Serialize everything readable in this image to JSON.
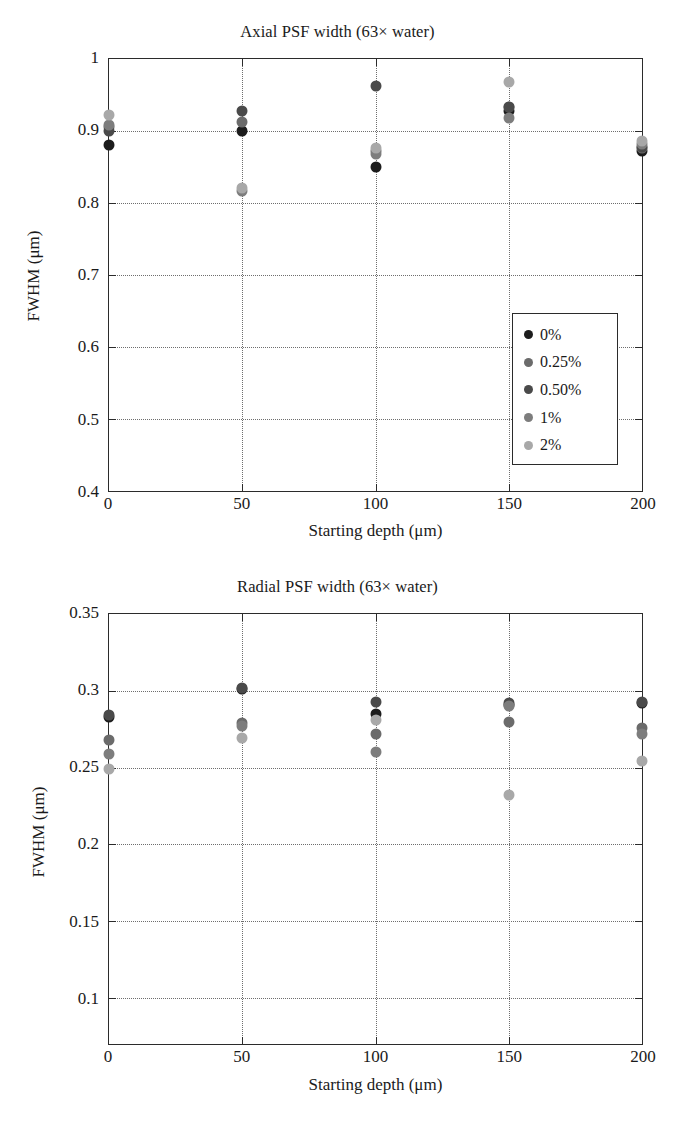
{
  "figures": [
    {
      "id": "axial",
      "title": "Axial PSF width (63× water)",
      "xlabel": "Starting depth (μm)",
      "ylabel": "FWHM (μm)"
    },
    {
      "id": "radial",
      "title": "Radial PSF width (63× water)",
      "xlabel": "Starting depth (μm)",
      "ylabel": "FWHM (μm)"
    }
  ],
  "legend": {
    "entries": [
      {
        "label": "0%",
        "color": "#1c1c1c"
      },
      {
        "label": "0.25%",
        "color": "#6b6b6b"
      },
      {
        "label": "0.50%",
        "color": "#4a4a4a"
      },
      {
        "label": "1%",
        "color": "#7d7d7d"
      },
      {
        "label": "2%",
        "color": "#a8a8a8"
      }
    ]
  },
  "chart_data": [
    {
      "type": "scatter",
      "title": "Axial PSF width (63× water)",
      "xlabel": "Starting depth (μm)",
      "ylabel": "FWHM (μm)",
      "x": [
        0,
        50,
        100,
        150,
        200
      ],
      "xlim": [
        0,
        200
      ],
      "ylim": [
        0.4,
        1.0
      ],
      "xticks": [
        0,
        50,
        100,
        150,
        200
      ],
      "yticks": [
        0.4,
        0.5,
        0.6,
        0.7,
        0.8,
        0.9,
        1.0
      ],
      "ytick_labels": [
        "0.4",
        "0.5",
        "0.6",
        "0.7",
        "0.8",
        "0.9",
        "1"
      ],
      "xtick_labels": [
        "0",
        "50",
        "100",
        "150",
        "200"
      ],
      "gridlines_y": [
        0.5,
        0.6,
        0.7,
        0.8,
        0.9
      ],
      "gridlines_x": [
        50,
        100,
        150
      ],
      "grid": true,
      "legend_position": "lower right",
      "series": [
        {
          "name": "0%",
          "color": "#1c1c1c",
          "values": [
            0.88,
            0.9,
            0.85,
            0.928,
            0.872
          ]
        },
        {
          "name": "0.25%",
          "color": "#6b6b6b",
          "values": [
            0.905,
            0.912,
            0.872,
            0.934,
            0.876
          ]
        },
        {
          "name": "0.50%",
          "color": "#4a4a4a",
          "values": [
            0.9,
            0.928,
            0.962,
            0.933,
            0.878
          ]
        },
        {
          "name": "1%",
          "color": "#7d7d7d",
          "values": [
            0.908,
            0.816,
            0.868,
            0.918,
            0.882
          ]
        },
        {
          "name": "2%",
          "color": "#a8a8a8",
          "values": [
            0.922,
            0.821,
            0.876,
            0.968,
            0.886
          ]
        }
      ]
    },
    {
      "type": "scatter",
      "title": "Radial PSF width (63× water)",
      "xlabel": "Starting depth (μm)",
      "ylabel": "FWHM (μm)",
      "x": [
        0,
        50,
        100,
        150,
        200
      ],
      "xlim": [
        0,
        200
      ],
      "ylim": [
        0.07,
        0.35
      ],
      "xticks": [
        0,
        50,
        100,
        150,
        200
      ],
      "yticks": [
        0.1,
        0.15,
        0.2,
        0.25,
        0.3,
        0.35
      ],
      "ytick_labels": [
        "0.1",
        "0.15",
        "0.2",
        "0.25",
        "0.3",
        "0.35"
      ],
      "xtick_labels": [
        "0",
        "50",
        "100",
        "150",
        "200"
      ],
      "gridlines_y": [
        0.1,
        0.15,
        0.2,
        0.25,
        0.3
      ],
      "gridlines_x": [
        50,
        100,
        150
      ],
      "grid": true,
      "legend_position": "lower right",
      "series": [
        {
          "name": "0%",
          "color": "#1c1c1c",
          "values": [
            0.283,
            0.301,
            0.285,
            0.291,
            0.292
          ]
        },
        {
          "name": "0.25%",
          "color": "#6b6b6b",
          "values": [
            0.268,
            0.279,
            0.272,
            0.28,
            0.276
          ]
        },
        {
          "name": "0.50%",
          "color": "#4a4a4a",
          "values": [
            0.284,
            0.302,
            0.293,
            0.292,
            0.293
          ]
        },
        {
          "name": "1%",
          "color": "#7d7d7d",
          "values": [
            0.259,
            0.277,
            0.26,
            0.29,
            0.272
          ]
        },
        {
          "name": "2%",
          "color": "#a8a8a8",
          "values": [
            0.249,
            0.269,
            0.281,
            0.232,
            0.254
          ]
        }
      ]
    }
  ]
}
